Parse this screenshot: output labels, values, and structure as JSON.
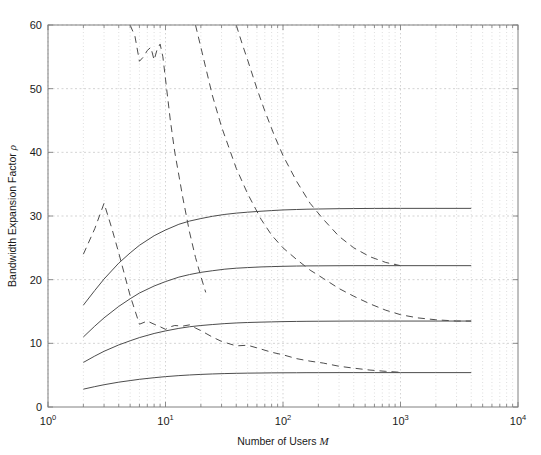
{
  "chart_data": {
    "type": "line",
    "title": "",
    "xlabel": "Number of Users M",
    "ylabel": "Bandwidth Expansion Factor ρ",
    "xscale": "log",
    "yscale": "linear",
    "xlim": [
      1,
      10000
    ],
    "ylim": [
      0,
      60
    ],
    "yticks": [
      0,
      10,
      20,
      30,
      40,
      50,
      60
    ],
    "ytick_labels": [
      "0",
      "10",
      "20",
      "30",
      "40",
      "50",
      "60"
    ],
    "xticks": [
      1,
      10,
      100,
      1000,
      10000
    ],
    "xtick_labels": [
      "10^0",
      "10^1",
      "10^2",
      "10^3",
      "10^4"
    ],
    "grid": "minor-dotted-major-dashed",
    "legend": "none",
    "line_color": "#4d4d4d",
    "grid_color": "#c8c8c8",
    "axis_color": "#808080",
    "series": [
      {
        "name": "theoretical-asymptote-1",
        "style": "solid",
        "x": [
          2,
          2.5,
          3,
          4,
          5,
          6,
          8,
          10,
          13,
          16,
          20,
          25,
          32,
          40,
          50,
          65,
          80,
          100,
          130,
          160,
          200,
          300,
          400,
          600,
          1000,
          2000,
          4000
        ],
        "y": [
          16.0,
          18.3,
          20.1,
          22.6,
          24.2,
          25.4,
          26.9,
          27.8,
          28.7,
          29.2,
          29.6,
          29.95,
          30.25,
          30.45,
          30.6,
          30.75,
          30.85,
          30.95,
          31.02,
          31.07,
          31.1,
          31.15,
          31.17,
          31.19,
          31.2,
          31.2,
          31.2
        ]
      },
      {
        "name": "theoretical-asymptote-2",
        "style": "solid",
        "x": [
          2,
          2.5,
          3,
          4,
          5,
          6,
          8,
          10,
          13,
          16,
          20,
          25,
          32,
          40,
          50,
          65,
          80,
          100,
          130,
          160,
          200,
          300,
          400,
          600,
          1000,
          2000,
          4000
        ],
        "y": [
          11.0,
          12.7,
          14.0,
          15.8,
          17.0,
          17.9,
          19.0,
          19.7,
          20.4,
          20.8,
          21.15,
          21.4,
          21.65,
          21.8,
          21.9,
          22.0,
          22.05,
          22.1,
          22.14,
          22.16,
          22.17,
          22.19,
          22.2,
          22.2,
          22.2,
          22.2,
          22.2
        ]
      },
      {
        "name": "theoretical-asymptote-3",
        "style": "solid",
        "x": [
          2,
          2.5,
          3,
          4,
          5,
          6,
          8,
          10,
          13,
          16,
          20,
          25,
          32,
          40,
          50,
          65,
          80,
          100,
          130,
          160,
          200,
          300,
          400,
          600,
          1000,
          2000,
          4000
        ],
        "y": [
          7.0,
          8.0,
          8.75,
          9.75,
          10.4,
          10.9,
          11.55,
          11.95,
          12.35,
          12.6,
          12.8,
          12.95,
          13.1,
          13.2,
          13.27,
          13.33,
          13.37,
          13.41,
          13.44,
          13.46,
          13.47,
          13.49,
          13.5,
          13.5,
          13.5,
          13.5,
          13.5
        ]
      },
      {
        "name": "theoretical-asymptote-4",
        "style": "solid",
        "x": [
          2,
          2.5,
          3,
          4,
          5,
          6,
          8,
          10,
          13,
          16,
          20,
          25,
          32,
          40,
          50,
          65,
          80,
          100,
          130,
          160,
          200,
          300,
          400,
          600,
          1000,
          2000,
          4000
        ],
        "y": [
          2.8,
          3.2,
          3.5,
          3.9,
          4.15,
          4.35,
          4.6,
          4.77,
          4.93,
          5.03,
          5.12,
          5.19,
          5.25,
          5.29,
          5.32,
          5.34,
          5.36,
          5.37,
          5.38,
          5.39,
          5.39,
          5.4,
          5.4,
          5.4,
          5.4,
          5.4,
          5.4
        ]
      },
      {
        "name": "simulated-noisy-curve",
        "style": "dashed",
        "x": [
          2,
          2.5,
          3,
          3.5,
          4,
          5,
          6,
          7,
          8,
          9,
          10,
          11,
          12,
          14,
          16,
          18,
          20,
          25,
          30,
          40,
          50,
          65,
          80,
          100,
          130,
          170,
          220,
          300,
          400,
          550,
          750,
          1000
        ],
        "y": [
          24.0,
          28.0,
          32.0,
          28.0,
          24.2,
          17.5,
          13.0,
          13.5,
          13.0,
          12.6,
          12.2,
          12.6,
          12.8,
          12.7,
          12.9,
          12.4,
          12.0,
          11.0,
          10.3,
          9.6,
          9.7,
          9.1,
          8.6,
          8.2,
          7.6,
          7.2,
          6.9,
          6.4,
          6.1,
          5.8,
          5.6,
          5.45
        ]
      },
      {
        "name": "simulated-curve-upper",
        "style": "dashed",
        "x": [
          5,
          5.5,
          6,
          6.5,
          7,
          7.5,
          8,
          8.5,
          9,
          9.5,
          10,
          11,
          12,
          14,
          16,
          18,
          20,
          22
        ],
        "y": [
          60.0,
          58.2,
          54.3,
          55.0,
          56.0,
          56.5,
          54.5,
          56.2,
          57.0,
          55.0,
          51.5,
          45.0,
          40.0,
          33.0,
          27.5,
          23.5,
          20.5,
          18.0
        ]
      },
      {
        "name": "simulated-curve-mid",
        "style": "dashed",
        "x": [
          18,
          20,
          25,
          30,
          40,
          50,
          65,
          80,
          100,
          130,
          170,
          220,
          300,
          400,
          550,
          750,
          1000,
          1400,
          2000,
          3000,
          4000
        ],
        "y": [
          60.0,
          56.5,
          49.0,
          44.0,
          37.5,
          33.5,
          29.5,
          27.0,
          25.0,
          23.2,
          21.5,
          20.2,
          18.6,
          17.4,
          16.2,
          15.2,
          14.5,
          14.0,
          13.7,
          13.5,
          13.5
        ]
      },
      {
        "name": "simulated-curve-right",
        "style": "dashed",
        "x": [
          40,
          45,
          50,
          60,
          70,
          85,
          100,
          130,
          170,
          220,
          300,
          400,
          550,
          750,
          1000
        ],
        "y": [
          60.0,
          57.0,
          54.5,
          50.0,
          46.5,
          42.5,
          39.5,
          35.5,
          32.0,
          29.5,
          26.8,
          25.0,
          23.6,
          22.7,
          22.2
        ]
      }
    ]
  }
}
